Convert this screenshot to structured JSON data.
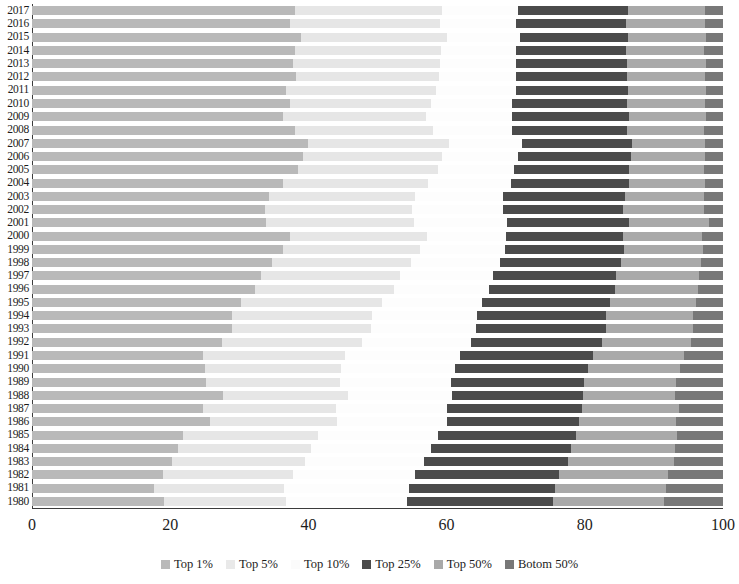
{
  "chart_data": {
    "type": "bar",
    "orientation": "horizontal",
    "stacked": true,
    "title": "",
    "xlabel": "",
    "ylabel": "",
    "xlim": [
      0,
      100
    ],
    "xticks": [
      "0",
      "20",
      "40",
      "60",
      "80",
      "100"
    ],
    "xtick_values": [
      0,
      20,
      40,
      60,
      80,
      100
    ],
    "grid": false,
    "legend_position": "bottom",
    "categories": [
      "2017",
      "2016",
      "2015",
      "2014",
      "2013",
      "2012",
      "2011",
      "2010",
      "2009",
      "2008",
      "2007",
      "2006",
      "2005",
      "2004",
      "2003",
      "2002",
      "2001",
      "2000",
      "1999",
      "1998",
      "1997",
      "1996",
      "1995",
      "1994",
      "1993",
      "1992",
      "1991",
      "1990",
      "1989",
      "1988",
      "1987",
      "1986",
      "1985",
      "1984",
      "1983",
      "1982",
      "1981",
      "1980"
    ],
    "series": [
      {
        "name": "Top 1%",
        "color": "#b9b9b9",
        "values": [
          38.0,
          37.3,
          39.0,
          38.0,
          37.8,
          38.2,
          36.7,
          37.4,
          36.3,
          38.0,
          39.9,
          39.2,
          38.5,
          36.3,
          34.3,
          33.7,
          33.9,
          37.4,
          36.3,
          34.8,
          33.2,
          32.3,
          30.3,
          29.0,
          29.0,
          27.5,
          24.8,
          25.1,
          25.2,
          27.6,
          24.8,
          25.8,
          21.8,
          21.1,
          20.3,
          19.0,
          17.6,
          19.1
        ]
      },
      {
        "name": "Top 5%",
        "color": "#e6e6e6",
        "values": [
          21.4,
          21.8,
          21.0,
          21.2,
          21.3,
          20.7,
          21.8,
          20.3,
          20.7,
          20.0,
          20.4,
          20.1,
          20.3,
          21.0,
          21.1,
          21.3,
          21.4,
          19.8,
          19.8,
          20.0,
          20.1,
          20.1,
          20.3,
          20.2,
          20.1,
          20.3,
          20.5,
          19.6,
          19.4,
          18.2,
          19.2,
          18.3,
          19.6,
          19.3,
          19.2,
          18.8,
          18.9,
          17.7
        ]
      },
      {
        "name": "Top 10%",
        "color": "#fdfdfd",
        "values": [
          10.9,
          10.9,
          10.6,
          10.8,
          10.9,
          11.1,
          11.5,
          11.8,
          12.5,
          11.5,
          10.6,
          11.0,
          11.0,
          12.0,
          12.8,
          13.1,
          13.4,
          11.4,
          12.3,
          12.9,
          13.4,
          13.8,
          14.5,
          15.2,
          15.2,
          15.7,
          16.7,
          16.5,
          16.1,
          15.0,
          16.1,
          15.9,
          17.3,
          17.3,
          17.3,
          17.6,
          18.0,
          17.5
        ]
      },
      {
        "name": "Top 25%",
        "color": "#4b4b4b",
        "values": [
          15.9,
          16.0,
          15.7,
          15.9,
          16.1,
          16.1,
          16.3,
          16.6,
          16.9,
          16.6,
          15.9,
          16.4,
          16.6,
          17.1,
          17.6,
          17.5,
          17.7,
          17.0,
          17.3,
          17.5,
          17.8,
          18.1,
          18.6,
          18.7,
          18.7,
          19.0,
          19.2,
          19.3,
          19.2,
          19.0,
          19.5,
          19.2,
          20.0,
          20.3,
          20.7,
          20.9,
          21.2,
          21.1
        ]
      },
      {
        "name": "Top 50%",
        "color": "#a9a9a9",
        "values": [
          11.2,
          11.4,
          11.2,
          11.4,
          11.4,
          11.3,
          11.2,
          11.3,
          11.1,
          11.2,
          10.6,
          10.7,
          10.9,
          11.0,
          11.4,
          11.6,
          11.6,
          11.4,
          11.4,
          11.6,
          12.0,
          12.1,
          12.4,
          12.5,
          12.6,
          12.8,
          13.2,
          13.3,
          13.3,
          13.3,
          14.0,
          14.0,
          14.6,
          15.1,
          15.4,
          15.7,
          16.0,
          16.0
        ]
      },
      {
        "name": "Botom 50%",
        "color": "#787878",
        "values": [
          2.6,
          2.6,
          2.5,
          2.7,
          2.5,
          2.6,
          2.5,
          2.6,
          2.5,
          2.7,
          2.6,
          2.6,
          2.7,
          2.6,
          2.8,
          2.8,
          2.0,
          3.0,
          2.9,
          3.2,
          3.5,
          3.6,
          3.9,
          4.4,
          4.4,
          4.7,
          5.6,
          6.2,
          6.8,
          6.9,
          6.4,
          6.8,
          6.7,
          6.9,
          7.1,
          8.0,
          8.3,
          8.6
        ]
      }
    ]
  },
  "legend": {
    "items": [
      {
        "label": "Top 1%",
        "color": "#b9b9b9"
      },
      {
        "label": "Top 5%",
        "color": "#e9e9e9"
      },
      {
        "label": "Top 10%",
        "color": "#fbfbfb"
      },
      {
        "label": "Top 25%",
        "color": "#4b4b4b"
      },
      {
        "label": "Top 50%",
        "color": "#a9a9a9"
      },
      {
        "label": "Botom 50%",
        "color": "#787878"
      }
    ]
  }
}
